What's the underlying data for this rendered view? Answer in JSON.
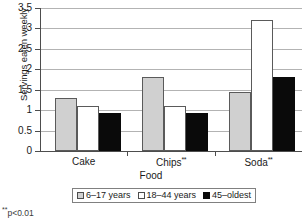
{
  "chart_data": {
    "type": "bar",
    "title": "",
    "xlabel": "Food",
    "ylabel": "Servings eaten weekly",
    "categories": [
      "Cake",
      "Chips**",
      "Soda**"
    ],
    "category_labels": [
      {
        "text": "Cake",
        "marker": ""
      },
      {
        "text": "Chips",
        "marker": "**"
      },
      {
        "text": "Soda",
        "marker": "**"
      }
    ],
    "series": [
      {
        "name": "6–17 years",
        "color": "#d0d0d0",
        "values": [
          1.3,
          1.8,
          1.45
        ]
      },
      {
        "name": "18–44 years",
        "color": "#ffffff",
        "values": [
          1.1,
          1.1,
          3.2
        ]
      },
      {
        "name": "45–oldest",
        "color": "#0a0a0a",
        "values": [
          0.93,
          0.92,
          1.8
        ]
      }
    ],
    "ylim": [
      0,
      3.5
    ],
    "ytick_step": 0.5,
    "yticks": [
      "0",
      "0.5",
      "1",
      "1.5",
      "2",
      "2.5",
      "3",
      "3.5"
    ],
    "ytick_values": [
      0,
      0.5,
      1,
      1.5,
      2,
      2.5,
      3,
      3.5
    ],
    "grid": true,
    "grid_axis": "y",
    "legend_position": "bottom"
  },
  "footnote": {
    "stars": "**",
    "text": "p<0.01"
  }
}
